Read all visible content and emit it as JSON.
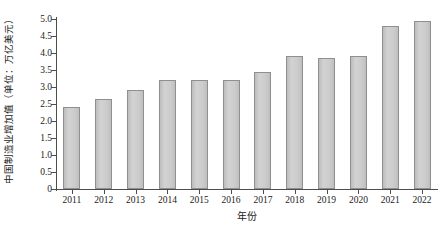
{
  "chart_data": {
    "type": "bar",
    "title": "",
    "subtitle": "",
    "xlabel": "年份",
    "ylabel": "中国制造业增加值（单位：万亿美元）",
    "categories": [
      "2011",
      "2012",
      "2013",
      "2014",
      "2015",
      "2016",
      "2017",
      "2018",
      "2019",
      "2020",
      "2021",
      "2022"
    ],
    "values": [
      2.4,
      2.65,
      2.9,
      3.2,
      3.2,
      3.2,
      3.45,
      3.9,
      3.85,
      3.9,
      4.8,
      4.95
    ],
    "series": [
      {
        "name": "中国制造业增加值",
        "values": [
          2.4,
          2.65,
          2.9,
          3.2,
          3.2,
          3.2,
          3.45,
          3.9,
          3.85,
          3.9,
          4.8,
          4.95
        ]
      }
    ],
    "ylim": [
      0,
      5.0
    ],
    "ytick_labels": [
      "0",
      "0.5",
      "1.0",
      "1.5",
      "2.0",
      "2.5",
      "3.0",
      "3.5",
      "4.0",
      "4.5",
      "5.0"
    ],
    "ytick_values": [
      0,
      0.5,
      1.0,
      1.5,
      2.0,
      2.5,
      3.0,
      3.5,
      4.0,
      4.5,
      5.0
    ],
    "grid": false,
    "legend": false,
    "legend_position": "none",
    "bar_fill_color": "#c9c9c9",
    "bar_border_color": "#8f8f8f",
    "axis_color": "#4d4d4d",
    "background_color": "#ffffff"
  }
}
